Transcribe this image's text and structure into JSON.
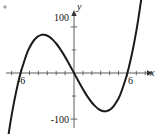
{
  "chart_data": {
    "type": "line",
    "title": "",
    "subtitle": "",
    "xlabel": "x",
    "ylabel": "y",
    "xlim": [
      -7.8,
      8.2
    ],
    "ylim": [
      -122,
      128
    ],
    "grid": false,
    "legend": null,
    "x_ticks": [
      -6,
      6
    ],
    "x_tick_labels": [
      "-6",
      "6"
    ],
    "y_ticks": [
      100,
      -100
    ],
    "y_tick_labels": [
      "100",
      "-100"
    ],
    "x_minor_tick_step": 1,
    "y_minor_tick_step": 50,
    "series": [
      {
        "name": "cubic",
        "x": [
          -7.6,
          -7.2,
          -6.8,
          -6.4,
          -6.0,
          -5.6,
          -5.2,
          -4.8,
          -4.4,
          -4.0,
          -3.6,
          -3.4641,
          -3.2,
          -2.8,
          -2.4,
          -2.0,
          -1.6,
          -1.2,
          -0.8,
          -0.4,
          0.0,
          0.4,
          0.8,
          1.2,
          1.6,
          2.0,
          2.4,
          2.8,
          3.2,
          3.4641,
          3.6,
          4.0,
          4.4,
          4.8,
          5.2,
          5.6,
          6.0,
          6.4,
          6.8,
          7.2,
          7.6,
          7.9
        ],
        "y": [
          -165.3,
          -114.3,
          -69.6,
          -31.8,
          0.0,
          25.0,
          46.7,
          62.1,
          73.2,
          80.0,
          83.0,
          83.1,
          82.4,
          78.8,
          72.4,
          64.0,
          53.5,
          41.5,
          28.3,
          14.3,
          0.0,
          -14.3,
          -28.3,
          -41.5,
          -53.5,
          -64.0,
          -72.4,
          -78.8,
          -82.4,
          -83.1,
          -83.0,
          -80.0,
          -73.2,
          -62.1,
          -46.7,
          -25.0,
          0.0,
          31.8,
          69.6,
          114.3,
          165.3,
          196.2
        ]
      }
    ],
    "curve_color": "#1a1a1a",
    "axis_color": "#4a4a4a",
    "equation_note": "y = x^3 - 36x"
  },
  "figure": {
    "background_color": "#ffffff",
    "corner_mark_name": "stray-mark"
  }
}
